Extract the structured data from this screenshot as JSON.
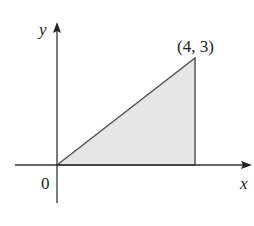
{
  "diagram": {
    "y_axis_label": "y",
    "x_axis_label": "x",
    "origin_label": "0",
    "vertex_label": "(4, 3)",
    "region": {
      "shape": "triangle",
      "vertices": [
        [
          0,
          0
        ],
        [
          4,
          0
        ],
        [
          4,
          3
        ]
      ],
      "fill": "#e6e6e6",
      "stroke": "#555555"
    },
    "colors": {
      "axis": "#333333",
      "background": "#ffffff"
    }
  }
}
